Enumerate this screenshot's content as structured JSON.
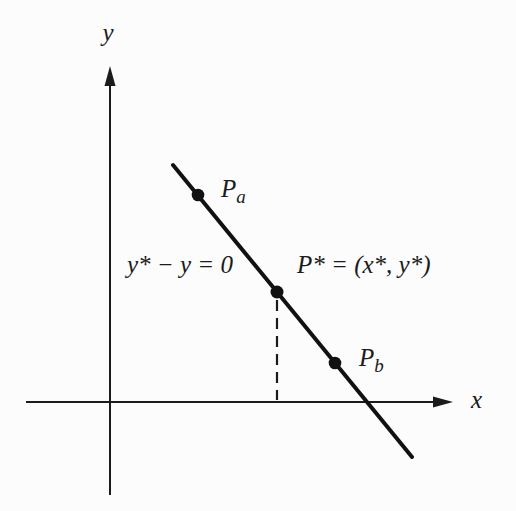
{
  "figure": {
    "background_color": "#fcfcfc",
    "ink_color": "#1b1b1b"
  },
  "axes": {
    "x_label": "x",
    "y_label": "y"
  },
  "labels": {
    "line_equation": "y* − y = 0",
    "p_star_equation": "P* = (x*, y*)",
    "point_a": {
      "main": "P",
      "sub": "a"
    },
    "point_b": {
      "main": "P",
      "sub": "b"
    }
  }
}
